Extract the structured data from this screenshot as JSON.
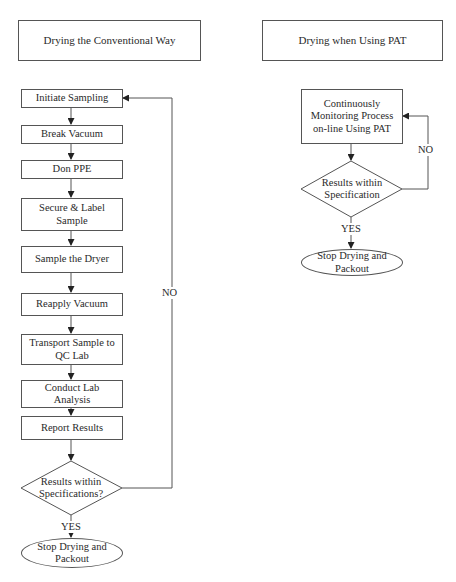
{
  "left": {
    "header": "Drying the Conventional Way",
    "steps": [
      "Initiate Sampling",
      "Break Vacuum",
      "Don PPE",
      "Secure & Label Sample",
      "Sample the Dryer",
      "Reapply Vacuum",
      "Transport Sample to QC Lab",
      "Conduct Lab Analysis",
      "Report Results"
    ],
    "decision": "Results within Specifications?",
    "no_label": "NO",
    "yes_label": "YES",
    "end": "Stop Drying and Packout"
  },
  "right": {
    "header": "Drying when Using PAT",
    "process": "Continuously Monitoring Process on-line Using PAT",
    "decision": "Results within Specification",
    "no_label": "NO",
    "yes_label": "YES",
    "end": "Stop Drying and Packout"
  }
}
